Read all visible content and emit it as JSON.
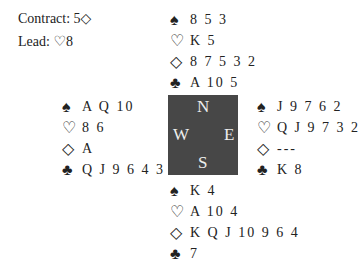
{
  "contract": {
    "label": "Contract:",
    "value": "5◇"
  },
  "lead": {
    "label": "Lead:",
    "value": "♡8"
  },
  "suits": {
    "spades": "♠",
    "hearts": "♡",
    "diamonds": "◇",
    "clubs": "♣"
  },
  "hands": {
    "north": {
      "spades": "8 5 3",
      "hearts": "K 5",
      "diamonds": "8 7 5 3 2",
      "clubs": "A 10 5"
    },
    "west": {
      "spades": "A Q 10",
      "hearts": "8 6",
      "diamonds": "A",
      "clubs": "Q J 9 6 4 3 2"
    },
    "east": {
      "spades": "J 9 7 6 2",
      "hearts": "Q J 9 7 3 2",
      "diamonds": "---",
      "clubs": "K 8"
    },
    "south": {
      "spades": "K 4",
      "hearts": "A 10 4",
      "diamonds": "K Q J 10 9 6 4",
      "clubs": "7"
    }
  },
  "compass": {
    "n": "N",
    "s": "S",
    "e": "E",
    "w": "W",
    "color": "#474747"
  }
}
